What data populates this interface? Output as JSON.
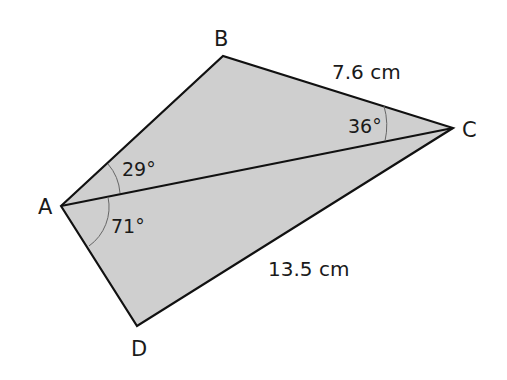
{
  "diagram": {
    "type": "quadrilateral-with-diagonal",
    "fill_color": "#cfcfcf",
    "stroke_color": "#111111",
    "vertices": {
      "A": {
        "label": "A",
        "x": 61,
        "y": 206
      },
      "B": {
        "label": "B",
        "x": 223,
        "y": 56
      },
      "C": {
        "label": "C",
        "x": 453,
        "y": 128
      },
      "D": {
        "label": "D",
        "x": 137,
        "y": 326
      }
    },
    "sides": {
      "BC": "7.6 cm",
      "CD": "13.5 cm"
    },
    "angles": {
      "BAC": "29°",
      "CAD": "71°",
      "BCA": "36°"
    }
  }
}
